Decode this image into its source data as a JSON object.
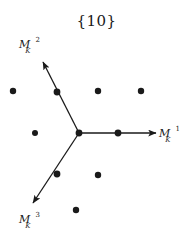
{
  "figure": {
    "title": "{10}",
    "background_color": "#ffffff",
    "ink_color": "#1a1a1a",
    "width": 193,
    "height": 240,
    "axes": [
      {
        "id": "m1",
        "label_base": "M",
        "label_sub": "K",
        "label_sup": "1",
        "label_text": "M_K^1",
        "direction_deg": 0,
        "from": [
          79,
          133
        ],
        "to": [
          156,
          133
        ],
        "label_pos": [
          159,
          126
        ]
      },
      {
        "id": "m2",
        "label_base": "M",
        "label_sub": "K",
        "label_sup": "2",
        "label_text": "M_K^2",
        "direction_deg": 120,
        "from": [
          79,
          133
        ],
        "to": [
          43,
          62
        ],
        "label_pos": [
          19,
          37
        ]
      },
      {
        "id": "m3",
        "label_base": "M",
        "label_sub": "K",
        "label_sup": "3",
        "label_text": "M_K^3",
        "direction_deg": 240,
        "from": [
          79,
          133
        ],
        "to": [
          33,
          203
        ],
        "label_pos": [
          19,
          212
        ]
      }
    ],
    "vertex": {
      "x": 79,
      "y": 133,
      "r": 3.4
    },
    "lattice_dots": [
      {
        "x": 13,
        "y": 91,
        "r": 3.2,
        "on_axis": false
      },
      {
        "x": 57,
        "y": 92,
        "r": 3.4,
        "on_axis": true
      },
      {
        "x": 98,
        "y": 91,
        "r": 3.2,
        "on_axis": false
      },
      {
        "x": 141,
        "y": 91,
        "r": 3.2,
        "on_axis": false
      },
      {
        "x": 35,
        "y": 133,
        "r": 3.0,
        "on_axis": false
      },
      {
        "x": 118,
        "y": 133,
        "r": 3.4,
        "on_axis": true
      },
      {
        "x": 57,
        "y": 174,
        "r": 3.4,
        "on_axis": true
      },
      {
        "x": 98,
        "y": 175,
        "r": 3.2,
        "on_axis": false
      },
      {
        "x": 76,
        "y": 210,
        "r": 3.2,
        "on_axis": false
      }
    ]
  }
}
